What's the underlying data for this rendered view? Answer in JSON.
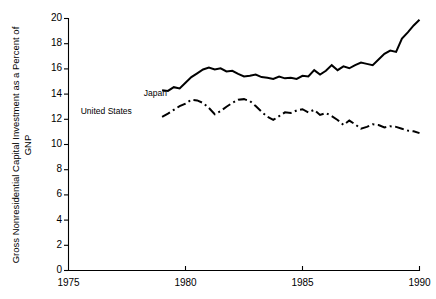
{
  "chart_data": {
    "type": "line",
    "title": "",
    "xlabel": "",
    "ylabel": "Gross Nonresidential Capital Investment as a Percent of GNP",
    "xlim": [
      1975,
      1990
    ],
    "ylim": [
      0,
      20
    ],
    "xticks": [
      1975,
      1980,
      1985,
      1990
    ],
    "yticks": [
      0,
      2,
      4,
      6,
      8,
      10,
      12,
      14,
      16,
      18,
      20
    ],
    "grid": false,
    "legend_position": "inline-left",
    "series": [
      {
        "name": "Japan",
        "style": "solid",
        "color": "#000000",
        "label_x": 1980.1,
        "label_y": 14.0,
        "x": [
          1979.0,
          1979.25,
          1979.5,
          1979.75,
          1980.0,
          1980.25,
          1980.5,
          1980.75,
          1981.0,
          1981.25,
          1981.5,
          1981.75,
          1982.0,
          1982.25,
          1982.5,
          1982.75,
          1983.0,
          1983.25,
          1983.5,
          1983.75,
          1984.0,
          1984.25,
          1984.5,
          1984.75,
          1985.0,
          1985.25,
          1985.5,
          1985.75,
          1986.0,
          1986.25,
          1986.5,
          1986.75,
          1987.0,
          1987.25,
          1987.5,
          1987.75,
          1988.0,
          1988.25,
          1988.5,
          1988.75,
          1989.0,
          1989.25,
          1989.5,
          1989.75,
          1990.0
        ],
        "y": [
          14.3,
          14.25,
          14.55,
          14.45,
          14.9,
          15.35,
          15.65,
          15.95,
          16.1,
          15.95,
          16.05,
          15.8,
          15.85,
          15.6,
          15.4,
          15.45,
          15.55,
          15.35,
          15.3,
          15.2,
          15.4,
          15.25,
          15.3,
          15.2,
          15.45,
          15.4,
          15.9,
          15.55,
          15.85,
          16.3,
          15.9,
          16.2,
          16.05,
          16.3,
          16.5,
          16.4,
          16.3,
          16.75,
          17.2,
          17.45,
          17.35,
          18.4,
          18.9,
          19.45,
          19.9
        ]
      },
      {
        "name": "United States",
        "style": "dashdot",
        "color": "#000000",
        "label_x": 1978.6,
        "label_y": 12.6,
        "x": [
          1979.0,
          1979.25,
          1979.5,
          1979.75,
          1980.0,
          1980.25,
          1980.5,
          1980.75,
          1981.0,
          1981.25,
          1981.5,
          1981.75,
          1982.0,
          1982.25,
          1982.5,
          1982.75,
          1983.0,
          1983.25,
          1983.5,
          1983.75,
          1984.0,
          1984.25,
          1984.5,
          1984.75,
          1985.0,
          1985.25,
          1985.5,
          1985.75,
          1986.0,
          1986.25,
          1986.5,
          1986.75,
          1987.0,
          1987.25,
          1987.5,
          1987.75,
          1988.0,
          1988.25,
          1988.5,
          1988.75,
          1989.0,
          1989.25,
          1989.5,
          1989.75,
          1990.0
        ],
        "y": [
          12.2,
          12.45,
          12.75,
          13.05,
          13.25,
          13.55,
          13.5,
          13.3,
          12.9,
          12.4,
          12.65,
          13.0,
          13.3,
          13.55,
          13.6,
          13.45,
          13.05,
          12.6,
          12.2,
          11.95,
          12.25,
          12.55,
          12.5,
          12.7,
          12.8,
          12.55,
          12.75,
          12.35,
          12.5,
          12.25,
          11.95,
          11.55,
          11.9,
          11.6,
          11.25,
          11.4,
          11.6,
          11.55,
          11.35,
          11.45,
          11.4,
          11.25,
          11.1,
          11.05,
          10.9
        ]
      }
    ]
  },
  "axes": {
    "y_title": "Gross Nonresidential Capital Investment as a Percent of GNP",
    "y_tick_labels": [
      "20",
      "18",
      "16",
      "14",
      "12",
      "10",
      "8",
      "6",
      "4",
      "2",
      "0"
    ],
    "x_tick_labels": [
      "1975",
      "1980",
      "1985",
      "1990"
    ]
  },
  "labels": {
    "japan": "Japan",
    "united_states": "United States"
  }
}
